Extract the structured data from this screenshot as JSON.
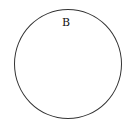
{
  "diagram": {
    "shape": "circle",
    "label": "B",
    "stroke_color": "#333333",
    "fill_color": "#ffffff"
  }
}
